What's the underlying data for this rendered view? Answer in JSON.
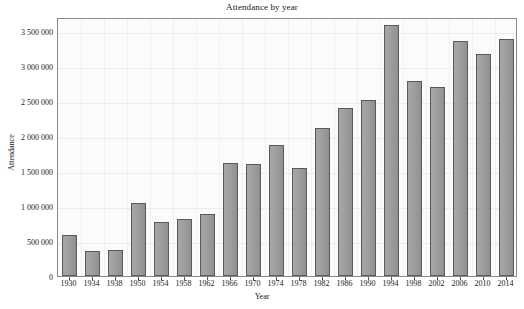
{
  "chart_data": {
    "type": "bar",
    "title": "Attendance by year",
    "xlabel": "Year",
    "ylabel": "Attendance",
    "categories": [
      "1930",
      "1934",
      "1938",
      "1950",
      "1954",
      "1958",
      "1962",
      "1966",
      "1970",
      "1974",
      "1978",
      "1982",
      "1986",
      "1990",
      "1994",
      "1998",
      "2002",
      "2006",
      "2010",
      "2014"
    ],
    "values": [
      590000,
      363000,
      375000,
      1045000,
      768000,
      820000,
      890000,
      1614000,
      1604000,
      1866000,
      1546000,
      2109000,
      2394000,
      2516000,
      3587000,
      2785000,
      2705000,
      3359000,
      3178000,
      3386000
    ],
    "ytick_labels": [
      "0",
      "500 000",
      "1 000 000",
      "1 500 000",
      "2 000 000",
      "2 500 000",
      "3 000 000",
      "3 500 000"
    ],
    "ytick_values": [
      0,
      500000,
      1000000,
      1500000,
      2000000,
      2500000,
      3000000,
      3500000
    ],
    "ylim": [
      0,
      3700000
    ],
    "grid": true,
    "legend": "none",
    "bar_color": "#9b9b9b",
    "bar_border_color": "#5a5a5a",
    "plot_background": "#fbfbfb",
    "axis_color": "#8a8a8a"
  }
}
